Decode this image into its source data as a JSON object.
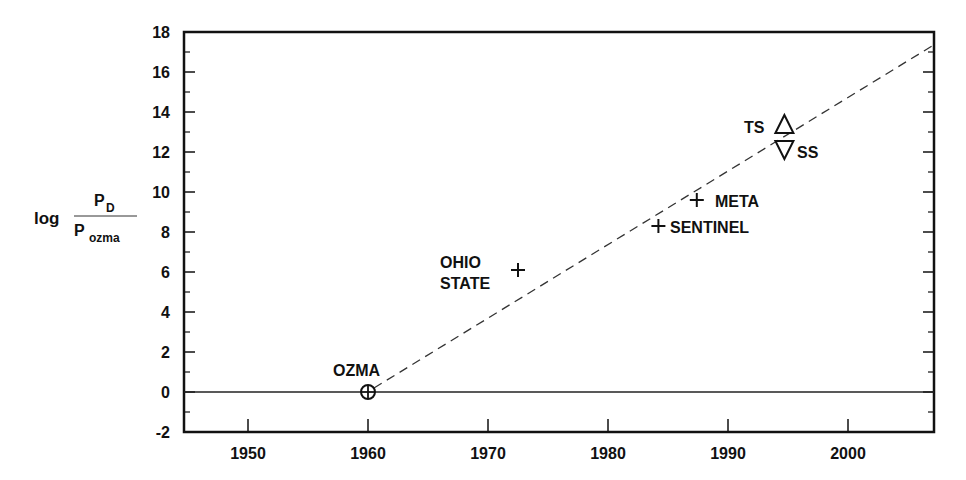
{
  "chart_data": {
    "type": "scatter",
    "title": "",
    "xlabel": "",
    "ylabel": {
      "prefix": "log",
      "numerator": "P",
      "numerator_sub": "D",
      "denominator": "P",
      "denominator_sub": "ozma"
    },
    "xlim": [
      1945,
      2007
    ],
    "ylim": [
      -2,
      18
    ],
    "x_ticks": [
      1950,
      1960,
      1970,
      1980,
      1990,
      2000
    ],
    "y_ticks": [
      18,
      16,
      14,
      12,
      10,
      8,
      6,
      4,
      2,
      0,
      -2
    ],
    "grid": false,
    "points": [
      {
        "label": "OZMA",
        "x": 1960,
        "y": 0,
        "marker": "circle-plus"
      },
      {
        "label": "OHIO STATE",
        "x": 1972.5,
        "y": 6.1,
        "marker": "plus"
      },
      {
        "label": "SENTINEL",
        "x": 1984.2,
        "y": 8.3,
        "marker": "plus"
      },
      {
        "label": "META",
        "x": 1987.4,
        "y": 9.6,
        "marker": "plus"
      },
      {
        "label": "TS",
        "x": 1994.7,
        "y": 13.3,
        "marker": "triangle-up"
      },
      {
        "label": "SS",
        "x": 1994.7,
        "y": 12.2,
        "marker": "triangle-down"
      }
    ],
    "lines": [
      {
        "name": "baseline",
        "style": "solid",
        "x": [
          1945,
          2007
        ],
        "y": [
          0,
          0
        ]
      },
      {
        "name": "trend",
        "style": "dashed",
        "x": [
          1960,
          2007
        ],
        "y": [
          0,
          17.3
        ]
      }
    ]
  },
  "labels": {
    "ylabel_log": "log",
    "ylabel_num": "P",
    "ylabel_num_sub": "D",
    "ylabel_den": "P",
    "ylabel_den_sub": "ozma",
    "ozma": "OZMA",
    "ohio1": "OHIO",
    "ohio2": "STATE",
    "sentinel": "SENTINEL",
    "meta": "META",
    "ts": "TS",
    "ss": "SS"
  }
}
